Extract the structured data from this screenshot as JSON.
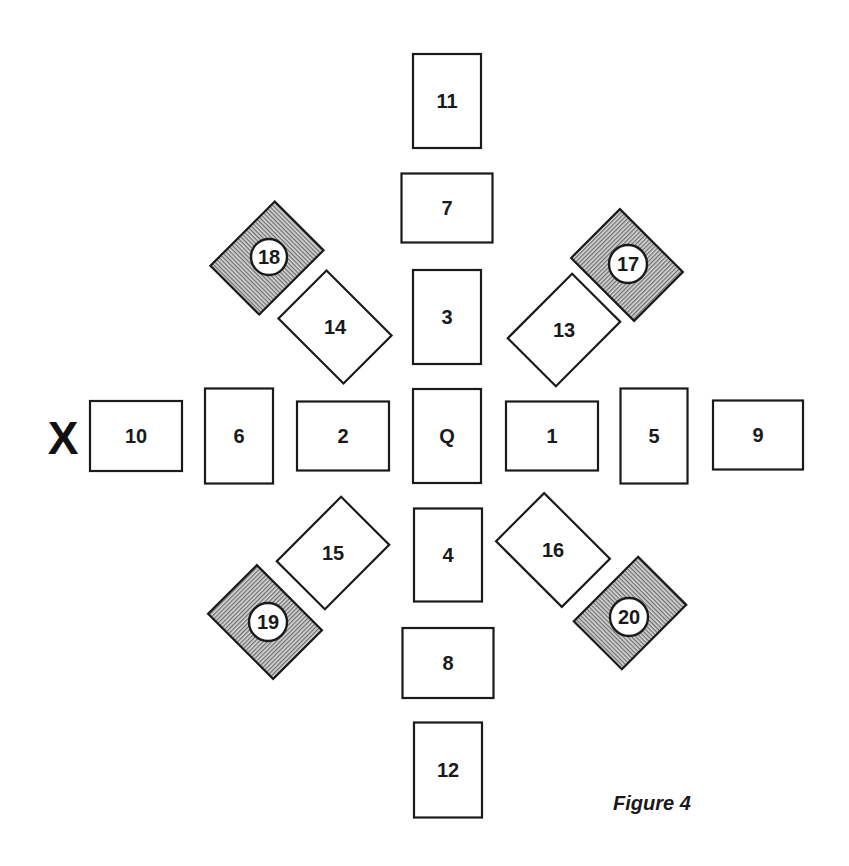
{
  "figure": {
    "caption": "Figure 4",
    "marker": "X",
    "colors": {
      "stroke": "#1a1a1a",
      "card_fill": "#ffffff",
      "hatch_line": "#6e6e6e",
      "hatch_bg": "#d8d8d8"
    },
    "cards": [
      {
        "label": "11",
        "cx": 447,
        "cy": 101,
        "w": 68,
        "h": 94,
        "rot": 0,
        "shaded": false
      },
      {
        "label": "7",
        "cx": 447,
        "cy": 208,
        "w": 91,
        "h": 69,
        "rot": 0,
        "shaded": false
      },
      {
        "label": "3",
        "cx": 447,
        "cy": 317,
        "w": 68,
        "h": 94,
        "rot": 0,
        "shaded": false
      },
      {
        "label": "Q",
        "cx": 447,
        "cy": 436,
        "w": 68,
        "h": 94,
        "rot": 0,
        "shaded": false
      },
      {
        "label": "4",
        "cx": 448,
        "cy": 555,
        "w": 68,
        "h": 93,
        "rot": 0,
        "shaded": false
      },
      {
        "label": "8",
        "cx": 448,
        "cy": 663,
        "w": 91,
        "h": 70,
        "rot": 0,
        "shaded": false
      },
      {
        "label": "12",
        "cx": 448,
        "cy": 770,
        "w": 68,
        "h": 95,
        "rot": 0,
        "shaded": false
      },
      {
        "label": "10",
        "cx": 136,
        "cy": 436,
        "w": 92,
        "h": 70,
        "rot": 0,
        "shaded": false
      },
      {
        "label": "6",
        "cx": 239,
        "cy": 436,
        "w": 68,
        "h": 95,
        "rot": 0,
        "shaded": false
      },
      {
        "label": "2",
        "cx": 343,
        "cy": 436,
        "w": 92,
        "h": 69,
        "rot": 0,
        "shaded": false
      },
      {
        "label": "1",
        "cx": 552,
        "cy": 436,
        "w": 92,
        "h": 69,
        "rot": 0,
        "shaded": false
      },
      {
        "label": "5",
        "cx": 654,
        "cy": 436,
        "w": 67,
        "h": 95,
        "rot": 0,
        "shaded": false
      },
      {
        "label": "9",
        "cx": 758,
        "cy": 435,
        "w": 90,
        "h": 69,
        "rot": 0,
        "shaded": false
      },
      {
        "label": "14",
        "cx": 335,
        "cy": 327,
        "w": 92,
        "h": 68,
        "rot": 45,
        "shaded": false
      },
      {
        "label": "13",
        "cx": 564,
        "cy": 330,
        "w": 91,
        "h": 68,
        "rot": -45,
        "shaded": false
      },
      {
        "label": "15",
        "cx": 333,
        "cy": 553,
        "w": 91,
        "h": 68,
        "rot": -45,
        "shaded": false
      },
      {
        "label": "16",
        "cx": 553,
        "cy": 550,
        "w": 93,
        "h": 68,
        "rot": 45,
        "shaded": false
      },
      {
        "label": "18",
        "cx": 267,
        "cy": 258,
        "w": 69,
        "h": 91,
        "rot": 45,
        "shaded": true,
        "badge": {
          "cx": 269,
          "cy": 257,
          "r": 18
        }
      },
      {
        "label": "17",
        "cx": 627,
        "cy": 265,
        "w": 69,
        "h": 89,
        "rot": -45,
        "shaded": true,
        "badge": {
          "cx": 628,
          "cy": 264,
          "r": 19
        }
      },
      {
        "label": "19",
        "cx": 265,
        "cy": 622,
        "w": 69,
        "h": 92,
        "rot": -45,
        "shaded": true,
        "badge": {
          "cx": 268,
          "cy": 622,
          "r": 19
        }
      },
      {
        "label": "20",
        "cx": 630,
        "cy": 613,
        "w": 68,
        "h": 91,
        "rot": 45,
        "shaded": true,
        "badge": {
          "cx": 629,
          "cy": 617,
          "r": 19
        }
      }
    ],
    "marker_pos": {
      "x": 63,
      "y": 454
    },
    "caption_pos": {
      "x": 613,
      "y": 810
    }
  }
}
